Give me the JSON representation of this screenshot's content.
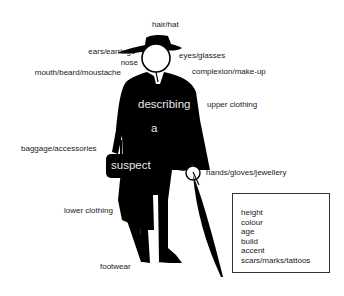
{
  "figure": {
    "overlay_words": [
      "describing",
      "a",
      "suspect"
    ],
    "labels": {
      "hair_hat": "hair/hat",
      "ears_earrings": "ears/earrings",
      "nose": "nose",
      "mouth_beard_moustache": "mouth/beard/moustache",
      "eyes_glasses": "eyes/glasses",
      "complexion_makeup": "complexion/make-up",
      "upper_clothing": "upper clothing",
      "baggage_accessories": "baggage/accessories",
      "hands_gloves_jewellery": "hands/gloves/jewellery",
      "lower_clothing": "lower clothing",
      "footwear": "footwear"
    },
    "general_attributes": [
      "height",
      "colour",
      "age",
      "build",
      "accent",
      "scars/marks/tattoos"
    ]
  }
}
